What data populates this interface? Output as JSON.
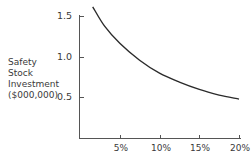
{
  "chart_data": {
    "type": "line",
    "title": "",
    "xlabel": "",
    "ylabel": "Safety Stock Investment ($000,000)",
    "ylabel_lines": [
      "Safety",
      "Stock",
      "Investment",
      "($000,000)"
    ],
    "x_ticks": [
      "5%",
      "10%",
      "15%",
      "20%"
    ],
    "y_ticks": [
      "0.5",
      "1.0",
      "1.5"
    ],
    "xlim": [
      0,
      20
    ],
    "ylim": [
      0,
      1.65
    ],
    "grid": false,
    "series": [
      {
        "name": "Safety stock investment",
        "x": [
          1.6,
          3.1,
          5,
          7.5,
          10,
          12.5,
          15,
          17.5,
          20
        ],
        "values": [
          1.62,
          1.38,
          1.17,
          0.96,
          0.8,
          0.69,
          0.6,
          0.53,
          0.48
        ]
      }
    ]
  }
}
